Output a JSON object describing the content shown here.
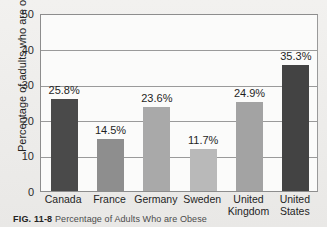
{
  "figure": {
    "caption_label": "FIG. 11-8",
    "caption_text": "Percentage of Adults Who are Obese"
  },
  "chart_data": {
    "type": "bar",
    "title": "Percentage of Adults Who are Obese",
    "xlabel": "",
    "ylabel": "Percentage of adults who are obese",
    "ylim": [
      0,
      50
    ],
    "yticks": [
      "0",
      "10",
      "20",
      "30",
      "40",
      "50"
    ],
    "grid": true,
    "legend": "none",
    "categories": [
      "Canada",
      "France",
      "Germany",
      "United Kingdom",
      "United States",
      "Sweden"
    ],
    "bars": [
      {
        "category": "Canada",
        "line1": "Canada",
        "line2": "",
        "value": 25.8,
        "label": "25.8%",
        "color": "#4a4a4a"
      },
      {
        "category": "France",
        "line1": "France",
        "line2": "",
        "value": 14.5,
        "label": "14.5%",
        "color": "#8e8e8e"
      },
      {
        "category": "Germany",
        "line1": "Germany",
        "line2": "",
        "value": 23.6,
        "label": "23.6%",
        "color": "#a9a9a9"
      },
      {
        "category": "Sweden",
        "line1": "Sweden",
        "line2": "",
        "value": 11.7,
        "label": "11.7%",
        "color": "#b9b9b9"
      },
      {
        "category": "United Kingdom",
        "line1": "United",
        "line2": "Kingdom",
        "value": 24.9,
        "label": "24.9%",
        "color": "#a3a3a3"
      },
      {
        "category": "United States",
        "line1": "United",
        "line2": "States",
        "value": 35.3,
        "label": "35.3%",
        "color": "#434343"
      }
    ]
  }
}
